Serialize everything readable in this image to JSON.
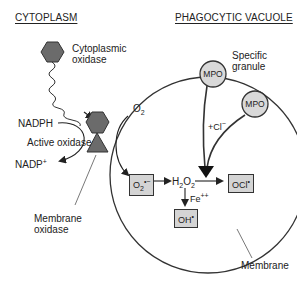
{
  "headers": {
    "cytoplasm": "CYTOPLASM",
    "vacuole": "PHAGOCYTIC VACUOLE"
  },
  "labels": {
    "cytoplasmic_oxidase_line1": "Cytoplasmic",
    "cytoplasmic_oxidase_line2": "oxidase",
    "nadph": "NADPH",
    "active_oxidase": "Active oxidase",
    "nadp_plus": "NADP",
    "nadp_sup": "+",
    "membrane_oxidase_line1": "Membrane",
    "membrane_oxidase_line2": "oxidase",
    "specific_granule_line1": "Specific",
    "specific_granule_line2": "granule",
    "membrane": "Membrane",
    "o2": "O",
    "o2_sub": "2",
    "chloride": "+Cl",
    "chloride_sup": "−",
    "h2o2_h": "H",
    "h2o2_sub1": "2",
    "h2o2_o": "O",
    "h2o2_sub2": "2",
    "fe": "Fe",
    "fe_sup": "++"
  },
  "granules": [
    {
      "label": "MPO"
    },
    {
      "label": "MPO"
    }
  ],
  "boxes": {
    "superoxide": {
      "base": "O",
      "sub": "2",
      "sup": "•−"
    },
    "hypochlorite": {
      "base": "OCl",
      "sup": "•"
    },
    "hydroxyl": {
      "base": "OH",
      "sup": "•"
    }
  },
  "colors": {
    "hexagon": "#6b6b6b",
    "triangle": "#6b6b6b",
    "granule_fill": "#d9d9d9",
    "box_fill": "#d4d4d4",
    "line": "#222222"
  }
}
